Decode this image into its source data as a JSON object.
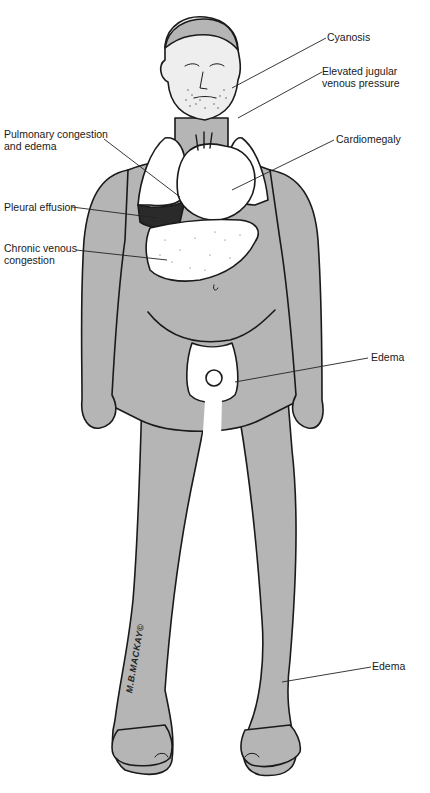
{
  "figure": {
    "colors": {
      "skin": "#b5b5b5",
      "outline": "#1a1a1a",
      "organs": "#ffffff",
      "leader_line": "#222222",
      "background": "#ffffff"
    }
  },
  "labels": {
    "cyanosis": "Cyanosis",
    "jvp_line1": "Elevated jugular",
    "jvp_line2": "venous pressure",
    "pulmonary_line1": "Pulmonary congestion",
    "pulmonary_line2": "and edema",
    "cardiomegaly": "Cardiomegaly",
    "pleural": "Pleural effusion",
    "hepatic_line1": "Chronic venous",
    "hepatic_line2": "congestion",
    "edema_scrotal": "Edema",
    "edema_ankle": "Edema"
  },
  "signature": "M.B.MACKAY©"
}
